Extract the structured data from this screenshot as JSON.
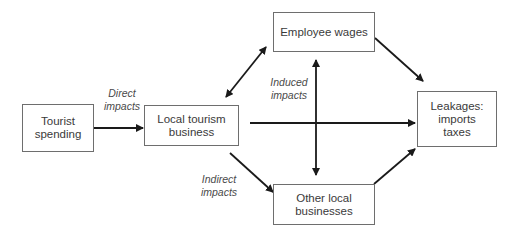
{
  "diagram": {
    "nodes": [
      {
        "id": "tourist",
        "lines": [
          "Tourist",
          "spending"
        ]
      },
      {
        "id": "local",
        "lines": [
          "Local tourism",
          "business"
        ]
      },
      {
        "id": "wages",
        "lines": [
          "Employee wages"
        ]
      },
      {
        "id": "other",
        "lines": [
          "Other local",
          "businesses"
        ]
      },
      {
        "id": "leakages",
        "lines": [
          "Leakages:",
          "imports",
          "taxes"
        ]
      }
    ],
    "labels": {
      "direct": [
        "Direct",
        "impacts"
      ],
      "indirect": [
        "Indirect",
        "impacts"
      ],
      "induced": [
        "Induced",
        "impacts"
      ]
    },
    "edges": [
      {
        "from": "tourist",
        "to": "local",
        "label": "Direct impacts"
      },
      {
        "from": "local",
        "to": "wages",
        "bidirectional": true
      },
      {
        "from": "local",
        "to": "other",
        "label": "Indirect impacts"
      },
      {
        "from": "local",
        "to": "leakages"
      },
      {
        "from": "wages",
        "to": "other",
        "bidirectional": true,
        "label": "Induced impacts"
      },
      {
        "from": "wages",
        "to": "leakages"
      },
      {
        "from": "other",
        "to": "leakages"
      }
    ],
    "colors": {
      "line": "#1a1a1a",
      "border": "#6e6e6e",
      "text": "#3a3a3a"
    }
  }
}
